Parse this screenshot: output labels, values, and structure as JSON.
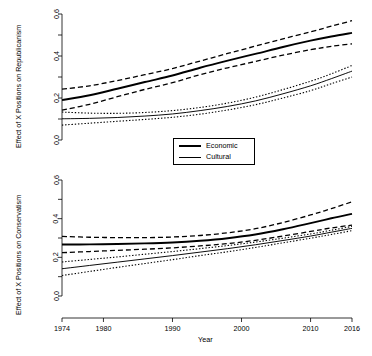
{
  "figure": {
    "xlabel": "Year",
    "background": "#ffffff",
    "line_color": "#000000"
  },
  "legend": {
    "position": "center-between-panels",
    "entries": [
      {
        "label": "Economic",
        "style": "solid-thick",
        "icon": "thick-line-icon"
      },
      {
        "label": "Cultural",
        "style": "solid-thin",
        "icon": "thin-line-icon"
      }
    ]
  },
  "chart_data": [
    {
      "type": "line",
      "panel": "top",
      "title": "",
      "xlabel": "",
      "ylabel": "Effect of X Positions on Republicanism",
      "xlim": [
        1974,
        2016
      ],
      "ylim": [
        0.0,
        0.6
      ],
      "xticks": [
        1974,
        1980,
        1990,
        2000,
        2010,
        2016
      ],
      "xticklabels": [
        "1974",
        "1980",
        "1990",
        "2000",
        "2010",
        "2016"
      ],
      "xticks_minor": [],
      "yticks": [
        0.0,
        0.1,
        0.2,
        0.3,
        0.4,
        0.5,
        0.6
      ],
      "yticklabels": [
        "0.0",
        "",
        "0.2",
        "",
        "0.4",
        "",
        "0.6"
      ],
      "grid": false,
      "x": [
        1974,
        1978,
        1982,
        1986,
        1990,
        1994,
        1998,
        2002,
        2006,
        2010,
        2013,
        2016
      ],
      "series": [
        {
          "name": "Economic",
          "style": "solid-thick",
          "values": [
            0.19,
            0.213,
            0.244,
            0.276,
            0.307,
            0.344,
            0.378,
            0.41,
            0.443,
            0.473,
            0.493,
            0.51
          ]
        },
        {
          "name": "Economic upper CI",
          "style": "dashed",
          "values": [
            0.242,
            0.258,
            0.283,
            0.311,
            0.34,
            0.376,
            0.412,
            0.447,
            0.482,
            0.515,
            0.542,
            0.568
          ]
        },
        {
          "name": "Economic lower CI",
          "style": "dashed",
          "values": [
            0.142,
            0.17,
            0.206,
            0.241,
            0.273,
            0.311,
            0.344,
            0.374,
            0.404,
            0.43,
            0.446,
            0.458
          ]
        },
        {
          "name": "Cultural",
          "style": "solid-thin",
          "values": [
            0.101,
            0.103,
            0.107,
            0.114,
            0.124,
            0.14,
            0.16,
            0.186,
            0.22,
            0.258,
            0.292,
            0.328
          ]
        },
        {
          "name": "Cultural upper CI",
          "style": "dotted",
          "values": [
            0.133,
            0.128,
            0.127,
            0.131,
            0.14,
            0.155,
            0.176,
            0.204,
            0.24,
            0.28,
            0.315,
            0.355
          ]
        },
        {
          "name": "Cultural lower CI",
          "style": "dotted",
          "values": [
            0.071,
            0.08,
            0.089,
            0.098,
            0.108,
            0.123,
            0.143,
            0.168,
            0.2,
            0.235,
            0.268,
            0.3
          ]
        }
      ]
    },
    {
      "type": "line",
      "panel": "bottom",
      "title": "",
      "xlabel": "Year",
      "ylabel": "Effect of X Positions on Conservatism",
      "xlim": [
        1974,
        2016
      ],
      "ylim": [
        0.0,
        0.6
      ],
      "xticks": [
        1974,
        1980,
        1990,
        2000,
        2010,
        2016
      ],
      "xticklabels": [
        "1974",
        "1980",
        "1990",
        "2000",
        "2010",
        "2016"
      ],
      "yticks": [
        0.0,
        0.1,
        0.2,
        0.3,
        0.4,
        0.5,
        0.6
      ],
      "yticklabels": [
        "0.0",
        "",
        "0.2",
        "",
        "0.4",
        "",
        "0.6"
      ],
      "grid": false,
      "x": [
        1974,
        1978,
        1982,
        1986,
        1990,
        1994,
        1998,
        2002,
        2006,
        2010,
        2013,
        2016
      ],
      "series": [
        {
          "name": "Economic",
          "style": "solid-thick",
          "values": [
            0.266,
            0.267,
            0.269,
            0.272,
            0.277,
            0.286,
            0.299,
            0.318,
            0.345,
            0.377,
            0.402,
            0.425
          ]
        },
        {
          "name": "Economic upper CI",
          "style": "dashed",
          "values": [
            0.308,
            0.304,
            0.302,
            0.302,
            0.305,
            0.313,
            0.327,
            0.348,
            0.38,
            0.419,
            0.452,
            0.487
          ]
        },
        {
          "name": "Economic lower CI",
          "style": "dashed",
          "values": [
            0.224,
            0.23,
            0.236,
            0.242,
            0.249,
            0.259,
            0.271,
            0.288,
            0.31,
            0.334,
            0.352,
            0.367
          ]
        },
        {
          "name": "Cultural",
          "style": "solid-thin",
          "values": [
            0.141,
            0.158,
            0.175,
            0.192,
            0.209,
            0.227,
            0.245,
            0.265,
            0.287,
            0.31,
            0.33,
            0.35
          ]
        },
        {
          "name": "Cultural upper CI",
          "style": "dotted",
          "values": [
            0.176,
            0.189,
            0.202,
            0.216,
            0.23,
            0.245,
            0.261,
            0.279,
            0.299,
            0.321,
            0.34,
            0.36
          ]
        },
        {
          "name": "Cultural lower CI",
          "style": "dotted",
          "values": [
            0.106,
            0.127,
            0.148,
            0.168,
            0.188,
            0.209,
            0.229,
            0.251,
            0.275,
            0.299,
            0.318,
            0.338
          ]
        }
      ]
    }
  ]
}
